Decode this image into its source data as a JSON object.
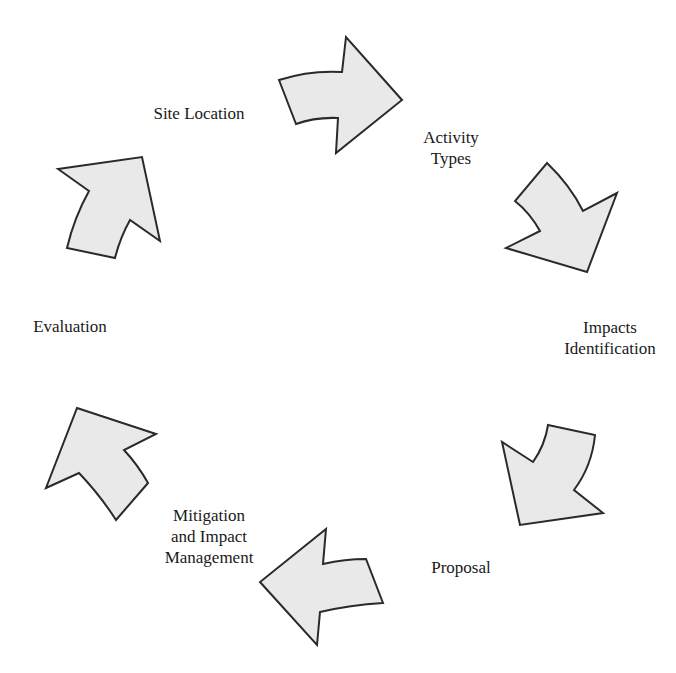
{
  "diagram": {
    "type": "cycle",
    "colors": {
      "arrow_fill": "#e9e9e9",
      "arrow_stroke": "#2a2a2a",
      "text": "#1a1a1a",
      "background": "#ffffff"
    },
    "stages": [
      {
        "id": "site-location",
        "label_lines": [
          "Site Location"
        ]
      },
      {
        "id": "activity-types",
        "label_lines": [
          "Activity",
          "Types"
        ]
      },
      {
        "id": "impacts-identification",
        "label_lines": [
          "Impacts",
          "Identification"
        ]
      },
      {
        "id": "proposal",
        "label_lines": [
          "Proposal"
        ]
      },
      {
        "id": "mitigation",
        "label_lines": [
          "Mitigation",
          "and Impact",
          "Management"
        ]
      },
      {
        "id": "evaluation",
        "label_lines": [
          "Evaluation"
        ]
      }
    ],
    "arrows": [
      {
        "from": "site-location",
        "to": "activity-types",
        "direction": "right"
      },
      {
        "from": "activity-types",
        "to": "impacts-identification",
        "direction": "down-right"
      },
      {
        "from": "impacts-identification",
        "to": "proposal",
        "direction": "down-left"
      },
      {
        "from": "proposal",
        "to": "mitigation",
        "direction": "left"
      },
      {
        "from": "mitigation",
        "to": "evaluation",
        "direction": "up-left"
      },
      {
        "from": "evaluation",
        "to": "site-location",
        "direction": "up-right"
      }
    ]
  }
}
